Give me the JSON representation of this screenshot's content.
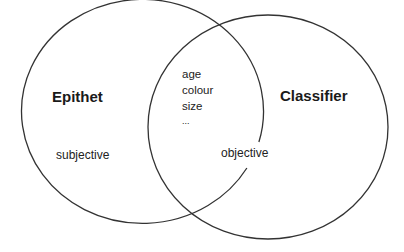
{
  "diagram": {
    "type": "venn",
    "line_color": "#333333",
    "sets": [
      {
        "id": "left",
        "title": "Epithet",
        "note": "subjective"
      },
      {
        "id": "right",
        "title": "Classifier",
        "note": "objective"
      }
    ],
    "overlap": {
      "items": [
        "age",
        "colour",
        "size",
        "..."
      ]
    }
  }
}
